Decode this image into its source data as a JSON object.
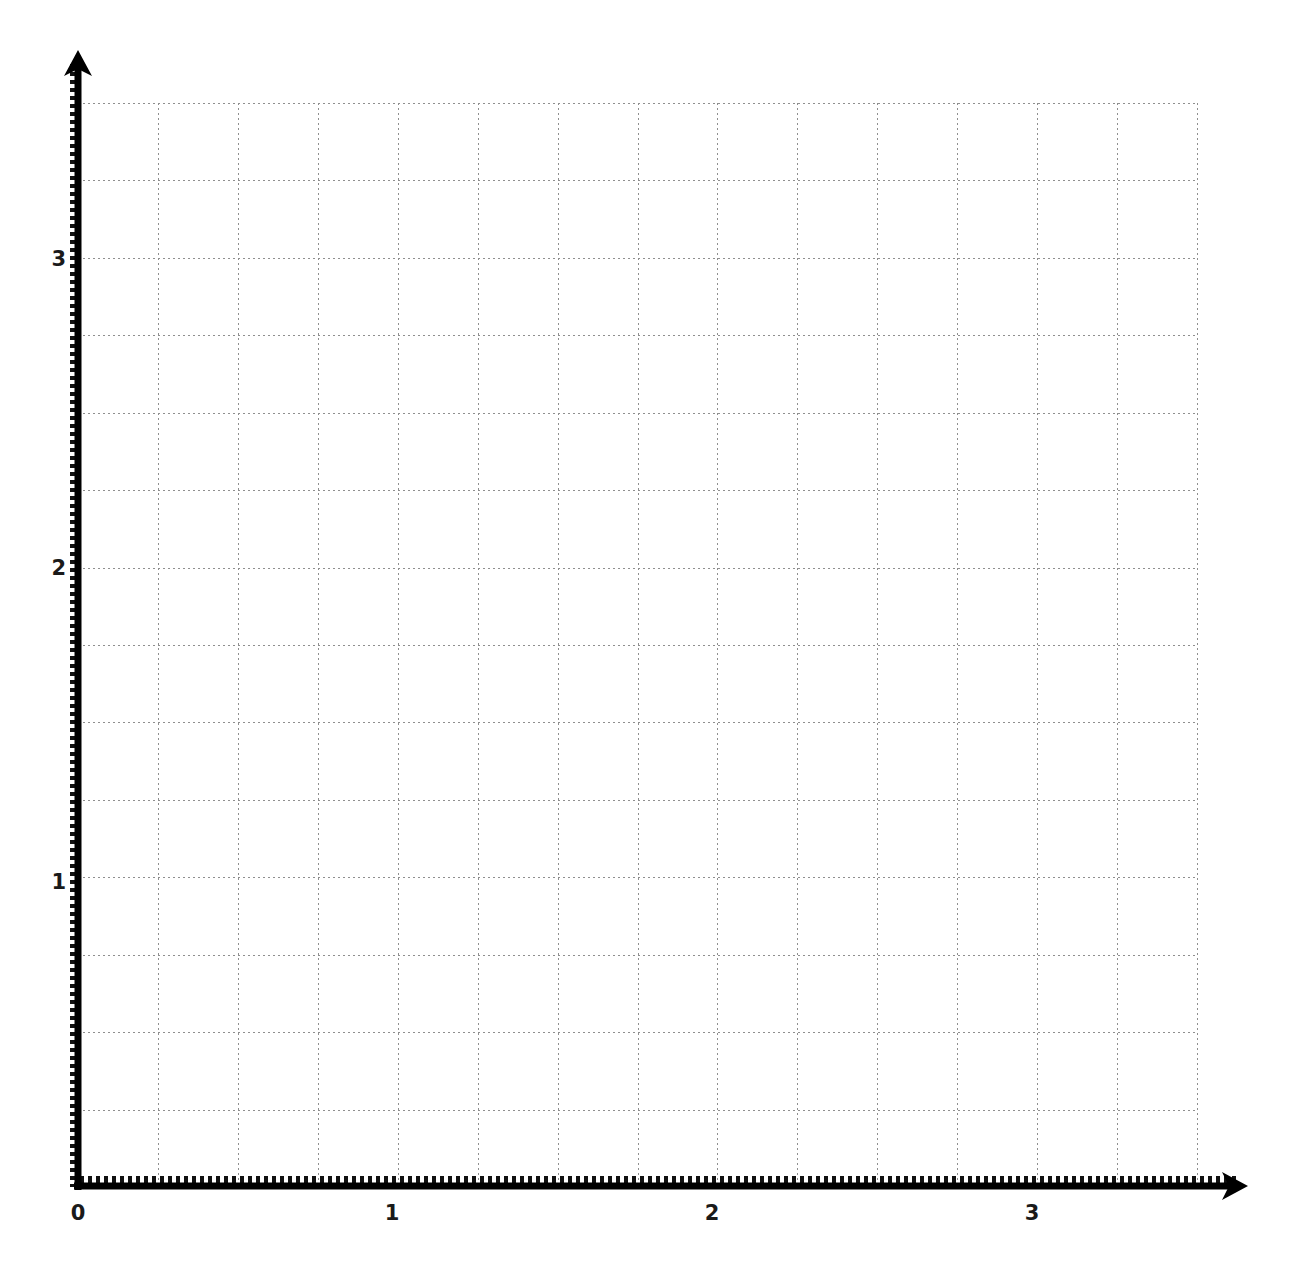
{
  "chart_data": {
    "type": "scatter",
    "title": "",
    "subtitle": "",
    "xlabel": "",
    "ylabel": "",
    "series": [],
    "x": [],
    "values": [],
    "grid": true,
    "grid_style": "dotted",
    "grid_color": "#8f8f8f",
    "minor_gridlines_per_unit": 4,
    "legend": null,
    "legend_position": "none",
    "xlim": [
      0,
      3.5
    ],
    "ylim": [
      0,
      3.5
    ],
    "x_ticks": [
      {
        "label": "0",
        "value": 0
      },
      {
        "label": "1",
        "value": 1
      },
      {
        "label": "2",
        "value": 2
      },
      {
        "label": "3",
        "value": 3
      }
    ],
    "y_ticks": [
      {
        "label": "1",
        "value": 1
      },
      {
        "label": "2",
        "value": 2
      },
      {
        "label": "3",
        "value": 3
      }
    ],
    "x_minor_values": [
      0.25,
      0.5,
      0.75,
      1.25,
      1.5,
      1.75,
      2.25,
      2.5,
      2.75,
      3.25,
      3.5
    ],
    "y_minor_values": [
      0.25,
      0.5,
      0.75,
      1.25,
      1.5,
      1.75,
      2.25,
      2.5,
      2.75,
      3.25,
      3.5
    ],
    "axis_color": "#000000",
    "background_color": "#ffffff",
    "x_axis_arrow": true,
    "y_axis_arrow": true,
    "annotations": []
  },
  "axes": {
    "x_axis_name": "x-axis",
    "y_axis_name": "y-axis",
    "origin_label": "0"
  }
}
